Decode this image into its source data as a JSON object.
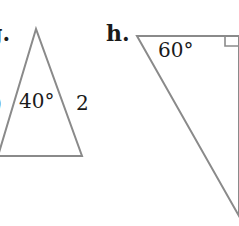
{
  "colors": {
    "stroke": "#8a8a8a",
    "text": "#1a1a1a",
    "background": "#ffffff"
  },
  "problems": [
    {
      "id": "g",
      "label": "g.",
      "shape": "isosceles-triangle",
      "angle_label": "40°",
      "side_label": "2",
      "left_side_label_partial": ")"
    },
    {
      "id": "h",
      "label": "h.",
      "shape": "right-triangle",
      "angle_label": "60°",
      "right_angle_marker": true
    }
  ]
}
